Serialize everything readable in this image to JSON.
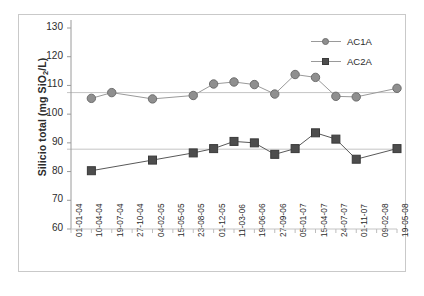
{
  "chart_data": {
    "type": "line",
    "title": "",
    "xlabel": "",
    "ylabel": "Silicio total (mg SiO2/L)",
    "ylabel_prefix": "Silicio total (mg SiO",
    "ylabel_sub": "2",
    "ylabel_suffix": "/L)",
    "ylim": [
      60,
      130
    ],
    "yticks": [
      60,
      70,
      80,
      90,
      100,
      110,
      120,
      130
    ],
    "grid": "horizontal-reference-lines",
    "legend_position": "top-right",
    "reference_lines": [
      107.5,
      87.8
    ],
    "categories": [
      "01-01-04",
      "10-04-04",
      "19-07-04",
      "27-10-04",
      "04-02-05",
      "15-05-05",
      "23-08-05",
      "01-12-05",
      "11-03-06",
      "19-06-06",
      "27-09-06",
      "05-01-07",
      "15-04-07",
      "24-07-07",
      "01-11-07",
      "09-02-08",
      "19-05-08"
    ],
    "series": [
      {
        "name": "AC1A",
        "color": "#8f8f8f",
        "marker": "circle",
        "x": [
          1,
          2,
          4,
          6,
          7,
          8,
          9,
          10,
          11,
          12,
          13,
          14,
          16
        ],
        "values": [
          105.5,
          107.5,
          105.3,
          106.5,
          110.5,
          111.2,
          110.3,
          107.0,
          113.8,
          112.8,
          106.2,
          106.0,
          109.0
        ]
      },
      {
        "name": "AC2A",
        "color": "#4d4d4d",
        "marker": "square",
        "x": [
          1,
          4,
          6,
          7,
          8,
          9,
          10,
          11,
          12,
          13,
          14,
          16
        ],
        "values": [
          80.3,
          84.0,
          86.5,
          88.0,
          90.5,
          90.0,
          86.0,
          88.0,
          93.5,
          91.3,
          84.3,
          88.0
        ]
      }
    ]
  },
  "legend": {
    "items": [
      {
        "label": "AC1A",
        "marker": "circle"
      },
      {
        "label": "AC2A",
        "marker": "square"
      }
    ]
  }
}
